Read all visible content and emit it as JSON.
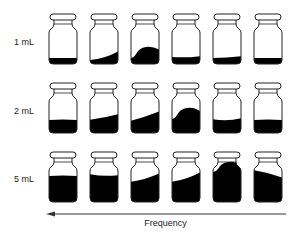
{
  "diagram": {
    "title": "",
    "rows": [
      {
        "label": "1 mL",
        "vials": [
          {
            "index": 1,
            "fill": "flat",
            "level": 0.12
          },
          {
            "index": 2,
            "fill": "tilted",
            "level": 0.14
          },
          {
            "index": 3,
            "fill": "wave",
            "level": 0.16
          },
          {
            "index": 4,
            "fill": "flat-slight",
            "level": 0.13
          },
          {
            "index": 5,
            "fill": "flat-slight",
            "level": 0.12
          },
          {
            "index": 6,
            "fill": "flat",
            "level": 0.12
          }
        ]
      },
      {
        "label": "2 mL",
        "vials": [
          {
            "index": 1,
            "fill": "flat",
            "level": 0.28
          },
          {
            "index": 2,
            "fill": "tilted",
            "level": 0.3
          },
          {
            "index": 3,
            "fill": "tilted",
            "level": 0.3
          },
          {
            "index": 4,
            "fill": "wave",
            "level": 0.32
          },
          {
            "index": 5,
            "fill": "flat-slight",
            "level": 0.28
          },
          {
            "index": 6,
            "fill": "flat",
            "level": 0.26
          }
        ]
      },
      {
        "label": "5 mL",
        "vials": [
          {
            "index": 1,
            "fill": "flat",
            "level": 0.55
          },
          {
            "index": 2,
            "fill": "flat-slight",
            "level": 0.57
          },
          {
            "index": 3,
            "fill": "tilted",
            "level": 0.5
          },
          {
            "index": 4,
            "fill": "tilted",
            "level": 0.55
          },
          {
            "index": 5,
            "fill": "wave",
            "level": 0.62
          },
          {
            "index": 6,
            "fill": "tilted",
            "level": 0.58
          }
        ]
      }
    ],
    "axis": {
      "label": "Frequency",
      "arrow_direction": "left"
    },
    "colors": {
      "liquid": "#000000",
      "outline": "#222222",
      "background": "#ffffff"
    }
  }
}
